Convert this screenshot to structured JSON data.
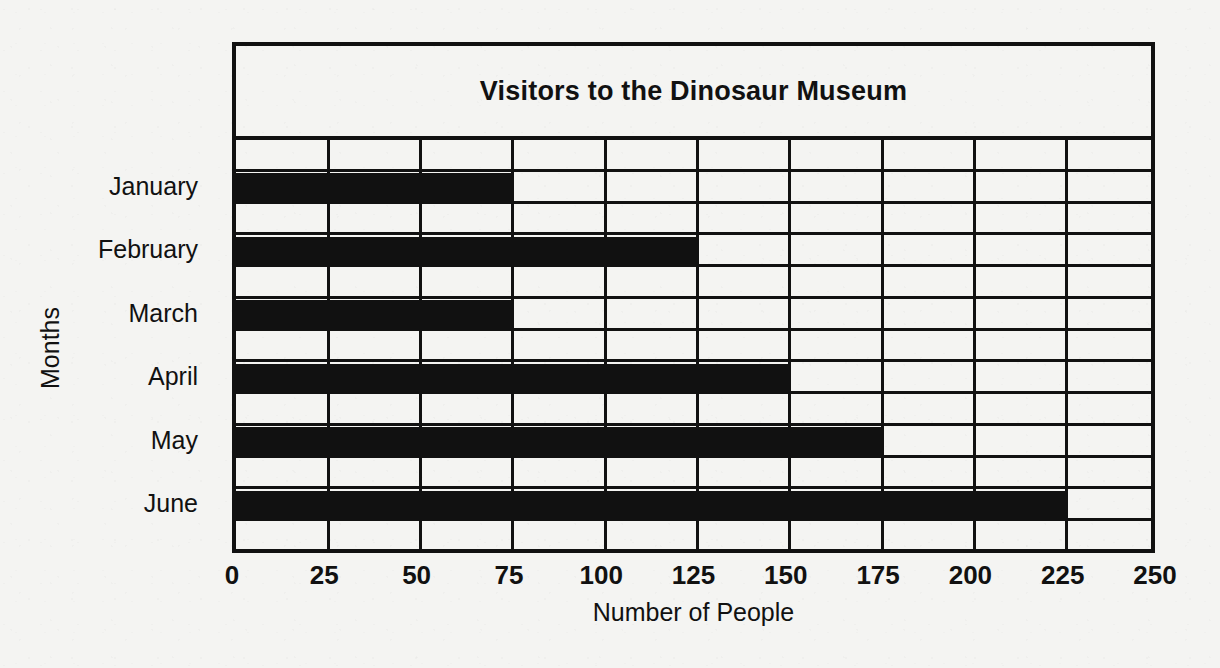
{
  "chart_data": {
    "type": "bar",
    "orientation": "horizontal",
    "title": "Visitors to the Dinosaur Museum",
    "xlabel": "Number of People",
    "ylabel": "Months",
    "categories": [
      "January",
      "February",
      "March",
      "April",
      "May",
      "June"
    ],
    "values": [
      75,
      125,
      75,
      150,
      175,
      225
    ],
    "xlim": [
      0,
      250
    ],
    "xticks": [
      0,
      25,
      50,
      75,
      100,
      125,
      150,
      175,
      200,
      225,
      250
    ],
    "xtick_labels": [
      "0",
      "25",
      "50",
      "75",
      "100",
      "125",
      "150",
      "175",
      "200",
      "225",
      "250"
    ],
    "grid": true,
    "legend": null,
    "series": [
      {
        "name": "Visitors",
        "values": [
          75,
          125,
          75,
          150,
          175,
          225
        ]
      }
    ],
    "bar_color": "#111111",
    "background_color": "#f4f4f2",
    "axis_color": "#111111"
  }
}
